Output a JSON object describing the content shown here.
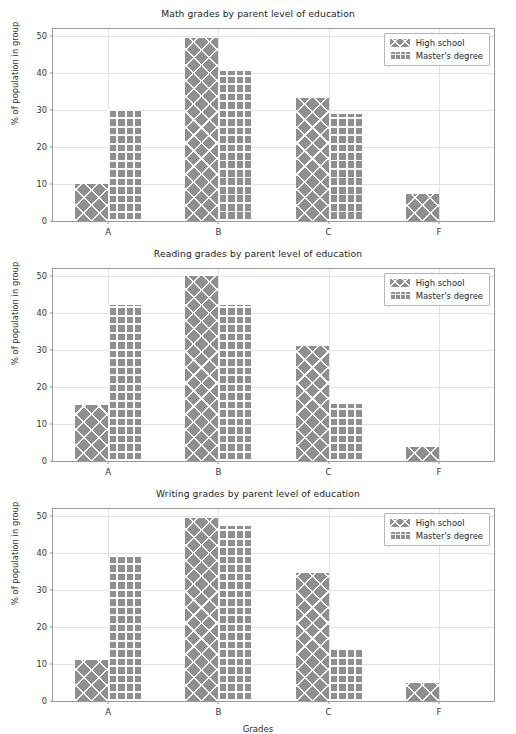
{
  "figure": {
    "width": 516,
    "height": 725,
    "background": "#ffffff",
    "bar_color": "#8f8f8f",
    "grid_color": "#e2e2e2",
    "axis_color": "#9a9a9a",
    "xlabel": "Grades"
  },
  "legend": {
    "position": "upper right",
    "entries": [
      {
        "label": "High school",
        "hatch": "xx",
        "key": "hs"
      },
      {
        "label": "Master's degree",
        "hatch": "++",
        "key": "md"
      }
    ]
  },
  "chart_data": [
    {
      "type": "bar",
      "title": "Math grades by parent level of education",
      "xlabel": "",
      "ylabel": "% of population in group",
      "categories": [
        "A",
        "B",
        "C",
        "F"
      ],
      "yticks": [
        0,
        10,
        20,
        30,
        40,
        50
      ],
      "ylim": [
        0,
        52
      ],
      "grid": true,
      "legend": "upper right",
      "series": [
        {
          "name": "High school",
          "hatch": "xx",
          "key": "hs",
          "values": [
            10.1,
            49.5,
            33.3,
            7.4
          ]
        },
        {
          "name": "Master's degree",
          "hatch": "++",
          "key": "md",
          "values": [
            30.4,
            40.7,
            29.0,
            0.0
          ]
        }
      ]
    },
    {
      "type": "bar",
      "title": "Reading grades by parent level of education",
      "xlabel": "",
      "ylabel": "% of population in group",
      "categories": [
        "A",
        "B",
        "C",
        "F"
      ],
      "yticks": [
        0,
        10,
        20,
        30,
        40,
        50
      ],
      "ylim": [
        0,
        52
      ],
      "grid": true,
      "legend": "upper right",
      "series": [
        {
          "name": "High school",
          "hatch": "xx",
          "key": "hs",
          "values": [
            15.1,
            50.0,
            31.1,
            3.9
          ]
        },
        {
          "name": "Master's degree",
          "hatch": "++",
          "key": "md",
          "values": [
            42.3,
            42.3,
            15.4,
            0.0
          ]
        }
      ]
    },
    {
      "type": "bar",
      "title": "Writing grades by parent level of education",
      "xlabel": "Grades",
      "ylabel": "% of population in group",
      "categories": [
        "A",
        "B",
        "C",
        "F"
      ],
      "yticks": [
        0,
        10,
        20,
        30,
        40,
        50
      ],
      "ylim": [
        0,
        52
      ],
      "grid": true,
      "legend": "upper right",
      "series": [
        {
          "name": "High school",
          "hatch": "xx",
          "key": "hs",
          "values": [
            11.0,
            49.5,
            34.8,
            4.8
          ]
        },
        {
          "name": "Master's degree",
          "hatch": "++",
          "key": "md",
          "values": [
            38.9,
            47.5,
            13.8,
            0.0
          ]
        }
      ]
    }
  ]
}
